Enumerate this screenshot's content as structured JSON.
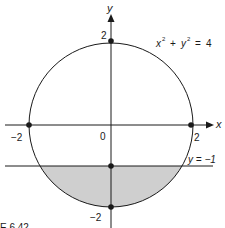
{
  "figure": {
    "caption": "E 6.42",
    "colors": {
      "stroke": "#1a1a1a",
      "shade": "#cfcfcf",
      "background": "#ffffff"
    },
    "axes": {
      "x_label": "x",
      "y_label": "y",
      "origin_label": "0"
    },
    "ticks": {
      "x_neg": "−2",
      "x_pos": "2",
      "y_pos": "2",
      "y_neg": "−2"
    },
    "equations": {
      "circle": {
        "lhs_x": "x",
        "lhs_y": "y",
        "exp": "2",
        "plus": "+",
        "eq": "=",
        "rhs": "4"
      },
      "line": "y = −1"
    },
    "points": [
      {
        "name": "top",
        "x": 0,
        "y": 2
      },
      {
        "name": "left",
        "x": -2,
        "y": 0
      },
      {
        "name": "right",
        "x": 2,
        "y": 0
      },
      {
        "name": "bottom",
        "x": 0,
        "y": -2
      },
      {
        "name": "line-intercept",
        "x": 0,
        "y": -1
      }
    ],
    "shaded_region": "part of disk x^2 + y^2 <= 4 below y = -1"
  }
}
